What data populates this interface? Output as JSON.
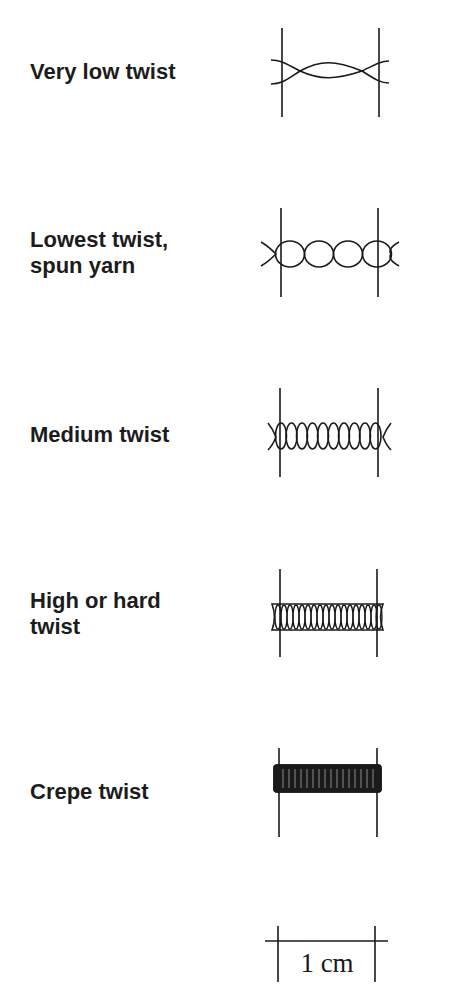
{
  "diagram": {
    "rows": [
      {
        "label_line1": "Very low twist",
        "label_line2": "",
        "twist_level": "very-low"
      },
      {
        "label_line1": "Lowest twist,",
        "label_line2": "spun yarn",
        "twist_level": "lowest-spun"
      },
      {
        "label_line1": "Medium twist",
        "label_line2": "",
        "twist_level": "medium"
      },
      {
        "label_line1": "High or hard",
        "label_line2": "twist",
        "twist_level": "high"
      },
      {
        "label_line1": "Crepe twist",
        "label_line2": "",
        "twist_level": "crepe"
      }
    ],
    "scale_bar": {
      "label": "1 cm"
    },
    "colors": {
      "ink": "#1a1a1a",
      "background": "#ffffff"
    }
  }
}
